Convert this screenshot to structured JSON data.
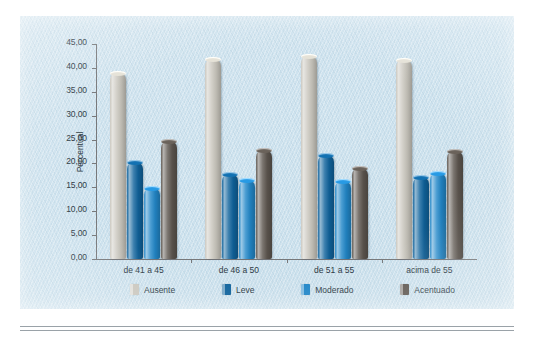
{
  "chart_data": {
    "type": "bar",
    "title": "",
    "xlabel": "",
    "ylabel": "Percentual",
    "ylim": [
      0,
      45
    ],
    "ytick_step": 5,
    "decimal_separator": ",",
    "grid": false,
    "legend_position": "bottom",
    "categories": [
      "de 41 a 45",
      "de 46 a 50",
      "de 51 a 55",
      "acima de 55"
    ],
    "ytick_labels": [
      "0,00",
      "5,00",
      "10,00",
      "15,00",
      "20,00",
      "25,00",
      "30,00",
      "35,00",
      "40,00",
      "45,00"
    ],
    "series": [
      {
        "name": "Ausente",
        "color": "#c9c6bd",
        "values": [
          39.0,
          41.8,
          42.4,
          41.6
        ]
      },
      {
        "name": "Leve",
        "color": "#10639c",
        "values": [
          20.3,
          17.7,
          21.8,
          17.2
        ]
      },
      {
        "name": "Moderado",
        "color": "#2287c8",
        "values": [
          14.9,
          16.6,
          16.4,
          18.1
        ]
      },
      {
        "name": "Acentuado",
        "color": "#5d564f",
        "values": [
          24.8,
          22.8,
          19.1,
          22.7
        ]
      }
    ]
  },
  "figure": {
    "background_color": "#cde2ee",
    "axis_color": "#77787a",
    "text_color": "#2e3b45"
  }
}
